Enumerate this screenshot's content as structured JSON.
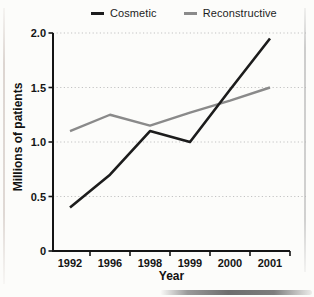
{
  "chart_data": {
    "type": "line",
    "categories": [
      "1992",
      "1996",
      "1998",
      "1999",
      "2000",
      "2001"
    ],
    "series": [
      {
        "name": "Cosmetic",
        "color": "#1c1c1c",
        "values": [
          0.4,
          0.7,
          1.1,
          1.0,
          1.48,
          1.95
        ]
      },
      {
        "name": "Reconstructive",
        "color": "#8a8a8a",
        "values": [
          1.1,
          1.25,
          1.15,
          1.27,
          1.38,
          1.5
        ]
      }
    ],
    "xlabel": "Year",
    "ylabel": "Millions of patients",
    "ylim": [
      0,
      2.0
    ],
    "yticks": [
      0,
      0.5,
      1.0,
      1.5,
      2.0
    ],
    "ytick_labels": [
      "0",
      "0.5",
      "1.0",
      "1.5",
      "2.0"
    ],
    "grid": "horizontal-dotted",
    "legend_position": "top-center",
    "colors": {
      "axis": "#141414",
      "gridline": "#c3c3c3",
      "background": "#fcfcfa"
    }
  }
}
